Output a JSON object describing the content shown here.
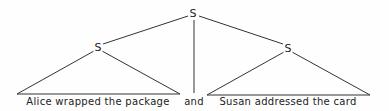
{
  "tree": {
    "root": {
      "label": "S"
    },
    "left": {
      "label": "S",
      "yield": "Alice wrapped the package"
    },
    "conjunction": {
      "label": "and"
    },
    "right": {
      "label": "S",
      "yield": "Susan addressed the card"
    }
  },
  "colors": {
    "line": "#333333",
    "text": "#222222",
    "background": "#fefefe"
  }
}
